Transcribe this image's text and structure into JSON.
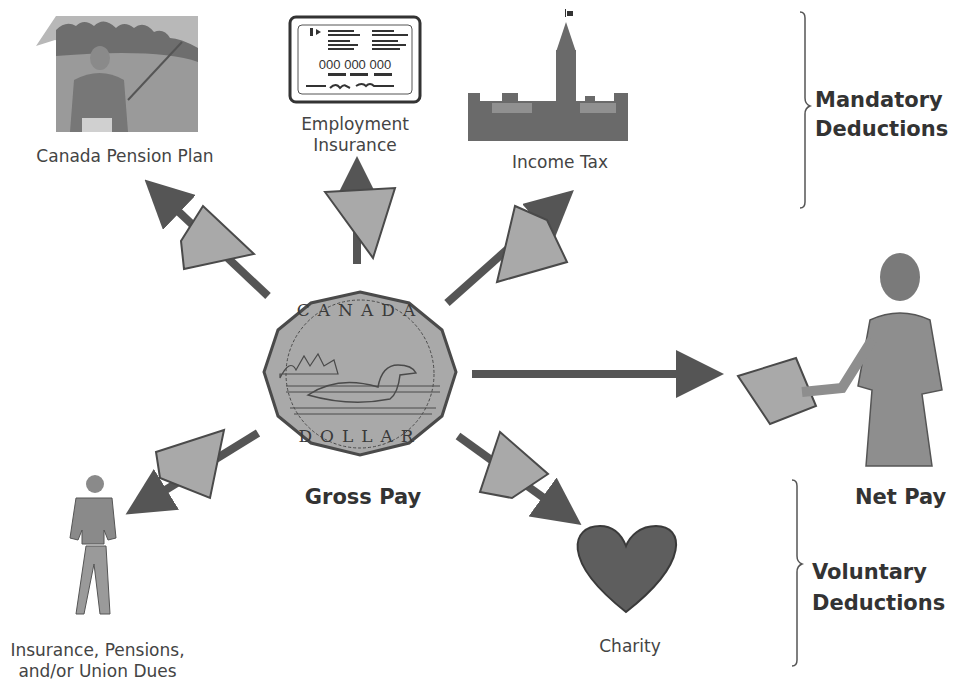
{
  "diagram": {
    "center": {
      "label": "Gross Pay",
      "coin_top_text": "CANADA",
      "coin_bottom_text": "DOLLAR"
    },
    "output": {
      "label": "Net Pay"
    },
    "groups": {
      "mandatory": {
        "line1": "Mandatory",
        "line2": "Deductions"
      },
      "voluntary": {
        "line1": "Voluntary",
        "line2": "Deductions"
      }
    },
    "deductions": [
      {
        "id": "cpp",
        "label": "Canada Pension Plan",
        "group": "mandatory",
        "icon": "golfer-icon",
        "coin_piece_text": "CA"
      },
      {
        "id": "ei",
        "label_line1": "Employment",
        "label_line2": "Insurance",
        "group": "mandatory",
        "icon": "id-card-icon",
        "card_number": "000 000 000",
        "coin_piece_text": "NA"
      },
      {
        "id": "tax",
        "label": "Income Tax",
        "group": "mandatory",
        "icon": "parliament-building-icon",
        "coin_piece_text": "DA"
      },
      {
        "id": "ins",
        "label_line1": "Insurance, Pensions,",
        "label_line2": "and/or Union Dues",
        "group": "voluntary",
        "icon": "walking-man-icon",
        "coin_piece_text": "D"
      },
      {
        "id": "charity",
        "label": "Charity",
        "group": "voluntary",
        "icon": "heart-icon",
        "coin_piece_text": "DLLA"
      }
    ],
    "colors": {
      "arrow": "#555555",
      "coin_fill": "#a9a9a9",
      "coin_stroke": "#4a4a4a",
      "heart": "#5a5a5a",
      "text": "#3a3a3a"
    }
  }
}
